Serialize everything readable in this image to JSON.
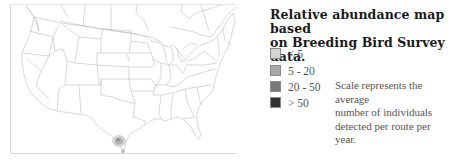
{
  "map": {
    "region": "Contiguous United States with southern Canada and northern Mexico",
    "line_color": "#bdbdbd",
    "shaded_area": "Southern Texas (Rio Grande Valley)"
  },
  "title": {
    "line1": "Relative abundance map based",
    "line2": "on Breeding Bird Survey data."
  },
  "legend": {
    "items": [
      {
        "label": "< 5",
        "color": "#d4d4d4"
      },
      {
        "label": "5 - 20",
        "color": "#a9a9a9"
      },
      {
        "label": "20 - 50",
        "color": "#7a7a7a"
      },
      {
        "label": "> 50",
        "color": "#333333"
      }
    ]
  },
  "note": {
    "line1": "Scale represents the average",
    "line2": "number of individuals",
    "line3": "detected per route per year."
  }
}
